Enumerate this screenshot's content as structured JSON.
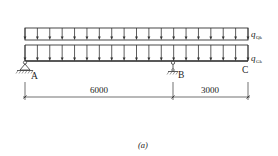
{
  "figure": {
    "caption": "(a)",
    "type": "continuous beam with overhang under uniformly distributed loads"
  },
  "loads": [
    {
      "id": "live",
      "symbol": "q",
      "subscript": "Qk",
      "label": "q_Qk",
      "arrow_count": 19
    },
    {
      "id": "dead",
      "symbol": "q",
      "subscript": "Gk",
      "label": "q_Gk",
      "arrow_count": 19
    }
  ],
  "supports": [
    {
      "id": "A",
      "label": "A",
      "type": "pin"
    },
    {
      "id": "B",
      "label": "B",
      "type": "roller"
    }
  ],
  "free_end": {
    "id": "C",
    "label": "C"
  },
  "dimensions": [
    {
      "from": "A",
      "to": "B",
      "value": "6000"
    },
    {
      "from": "B",
      "to": "C",
      "value": "3000"
    }
  ],
  "colors": {
    "line": "#333333",
    "background": "#ffffff"
  }
}
